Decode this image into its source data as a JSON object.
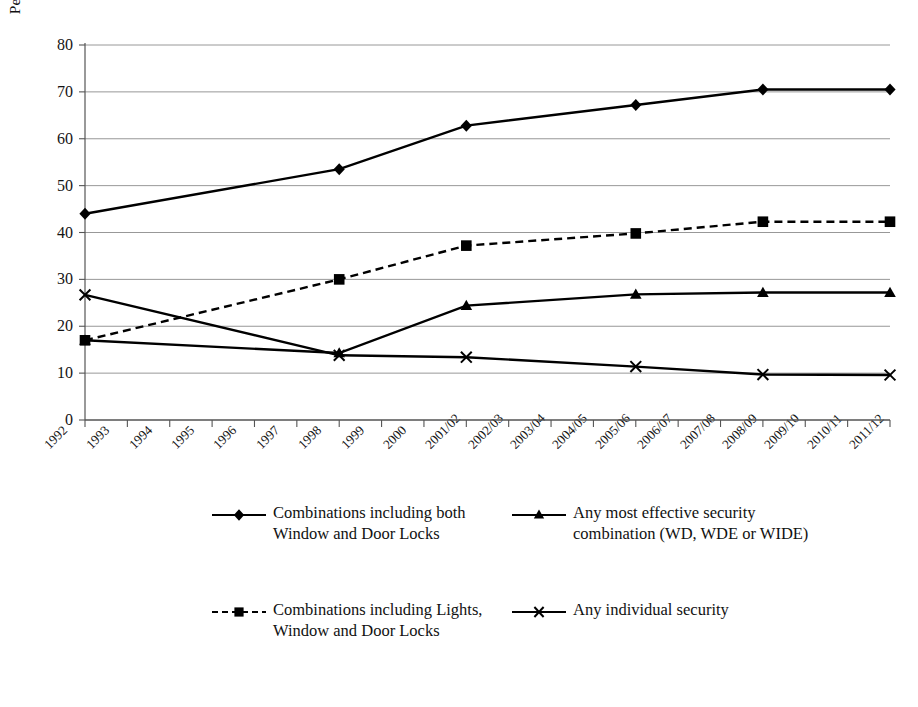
{
  "chart_data": {
    "type": "line",
    "title": "",
    "xlabel": "",
    "ylabel": "Percentage (%) of households",
    "ylim": [
      0,
      80
    ],
    "ytick_values": [
      0,
      10,
      20,
      30,
      40,
      50,
      60,
      70,
      80
    ],
    "ytick_labels": [
      "0",
      "10",
      "20",
      "30",
      "40",
      "50",
      "60",
      "70",
      "80"
    ],
    "grid": true,
    "legend_position": "below-plot",
    "categories": [
      "1992",
      "1993",
      "1994",
      "1995",
      "1996",
      "1997",
      "1998",
      "1999",
      "2000",
      "2001/02",
      "2002/03",
      "2003/04",
      "2004/05",
      "2005/06",
      "2006/07",
      "2007/08",
      "2008/09",
      "2009/10",
      "2010/11",
      "2011/12"
    ],
    "marker_categories": [
      "1992",
      "1998",
      "2001/02",
      "2005/06",
      "2008/09",
      "2011/12"
    ],
    "series": [
      {
        "name": "Combinations including both Window and Door Locks",
        "marker": "diamond",
        "linestyle": "solid",
        "color": "#000000",
        "x": [
          "1992",
          "1998",
          "2001/02",
          "2005/06",
          "2008/09",
          "2011/12"
        ],
        "values": [
          44.0,
          53.5,
          62.8,
          67.2,
          70.5,
          70.5
        ]
      },
      {
        "name": "Combinations including Lights, Window and Door Locks",
        "marker": "square",
        "linestyle": "dashed",
        "color": "#000000",
        "x": [
          "1992",
          "1998",
          "2001/02",
          "2005/06",
          "2008/09",
          "2011/12"
        ],
        "values": [
          17.0,
          30.0,
          37.2,
          39.8,
          42.3,
          42.3
        ]
      },
      {
        "name": "Any most effective security combination (WD, WDE or WIDE)",
        "marker": "triangle",
        "linestyle": "solid",
        "color": "#000000",
        "x": [
          "1992",
          "1998",
          "2001/02",
          "2005/06",
          "2008/09",
          "2011/12"
        ],
        "values": [
          17.0,
          14.3,
          24.4,
          26.8,
          27.2,
          27.2
        ]
      },
      {
        "name": "Any individual security",
        "marker": "x",
        "linestyle": "solid",
        "color": "#000000",
        "x": [
          "1992",
          "1998",
          "2001/02",
          "2005/06",
          "2008/09",
          "2011/12"
        ],
        "values": [
          26.7,
          13.8,
          13.4,
          11.4,
          9.7,
          9.6
        ]
      }
    ]
  },
  "axis": {
    "y_label": "Percentage (%) of households",
    "y_ticks": [
      "80",
      "70",
      "60",
      "50",
      "40",
      "30",
      "20",
      "10",
      "0"
    ],
    "x_ticks": [
      "1992",
      "1993",
      "1994",
      "1995",
      "1996",
      "1997",
      "1998",
      "1999",
      "2000",
      "2001/02",
      "2002/03",
      "2003/04",
      "2004/05",
      "2005/06",
      "2006/07",
      "2007/08",
      "2008/09",
      "2009/10",
      "2010/11",
      "2011/12"
    ]
  },
  "legend": {
    "entries": [
      {
        "label": "Combinations including both Window and Door Locks",
        "marker": "diamond-marker",
        "style": "solid"
      },
      {
        "label": "Any most effective security combination (WD, WDE or WIDE)",
        "marker": "triangle-marker",
        "style": "solid"
      },
      {
        "label": "Combinations including Lights, Window and Door Locks",
        "marker": "square-marker",
        "style": "dashed"
      },
      {
        "label": "Any individual security",
        "marker": "x-marker",
        "style": "solid"
      }
    ]
  },
  "colors": {
    "line": "#000000",
    "grid": "#8c8c8c",
    "axis": "#555555",
    "text": "#141414",
    "background": "#ffffff"
  }
}
